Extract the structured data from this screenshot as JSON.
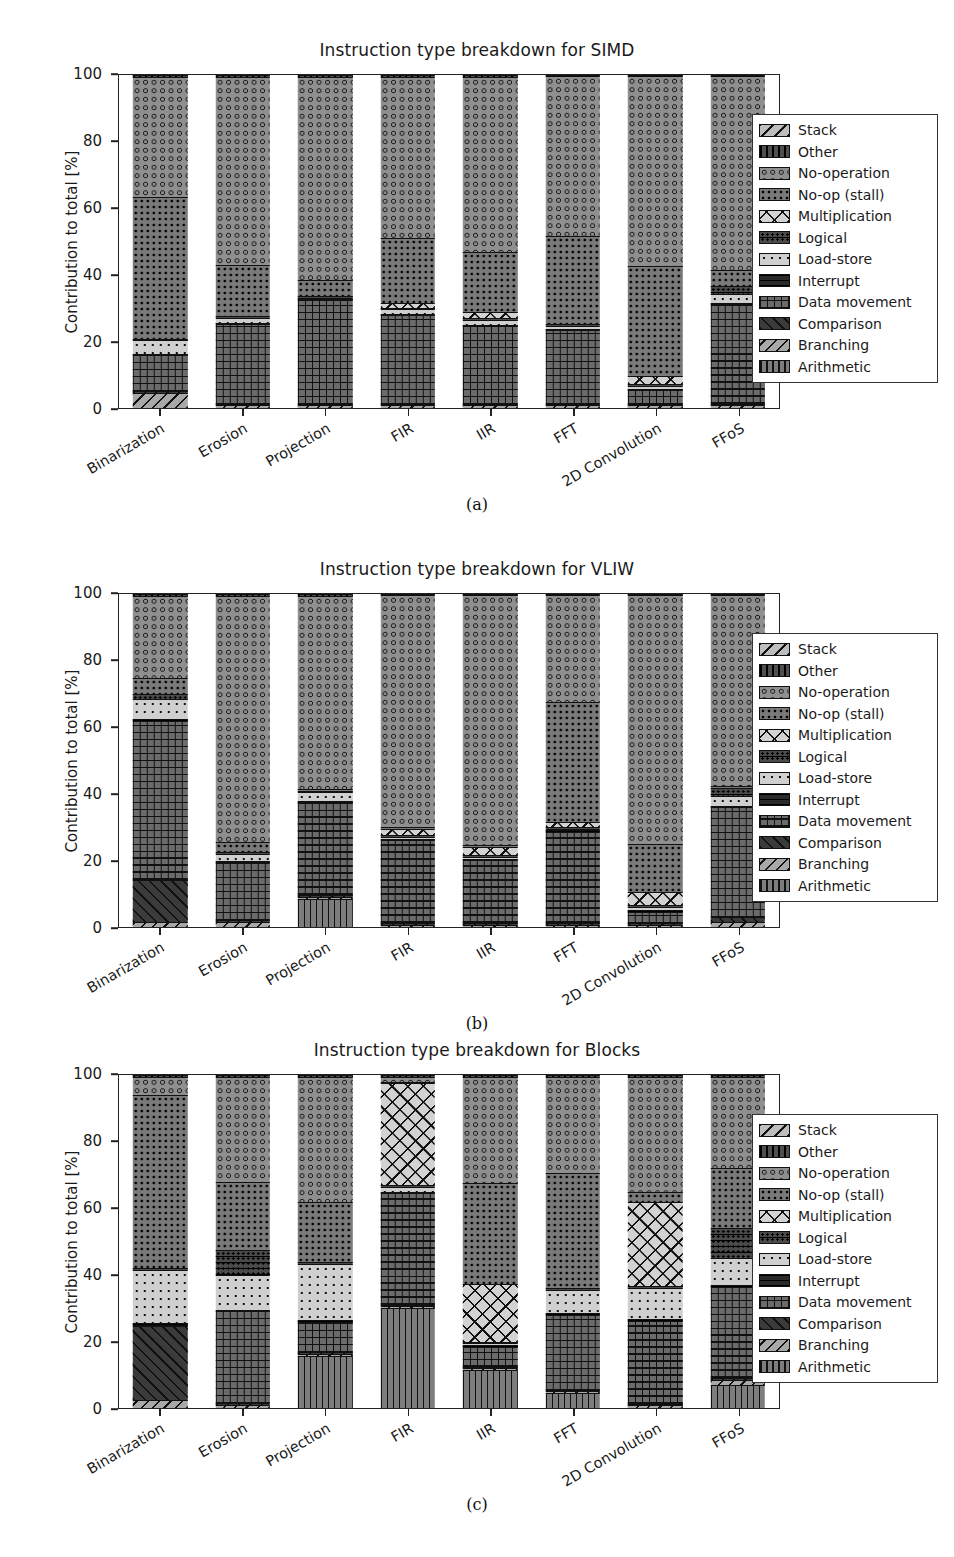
{
  "figure": {
    "ylabel": "Contribution to total [%]",
    "yticks": [
      0,
      20,
      40,
      60,
      80,
      100
    ],
    "ylim": [
      0,
      100
    ],
    "categories": [
      "Binarization",
      "Erosion",
      "Projection",
      "FIR",
      "IIR",
      "FFT",
      "2D Convolution",
      "FFoS"
    ],
    "legend_entries": [
      {
        "label": "Stack",
        "pattern": "p-stack"
      },
      {
        "label": "Other",
        "pattern": "p-other"
      },
      {
        "label": "No-operation",
        "pattern": "p-noop"
      },
      {
        "label": "No-op (stall)",
        "pattern": "p-nopstall"
      },
      {
        "label": "Multiplication",
        "pattern": "p-mult"
      },
      {
        "label": "Logical",
        "pattern": "p-logic"
      },
      {
        "label": "Load-store",
        "pattern": "p-load"
      },
      {
        "label": "Interrupt",
        "pattern": "p-int"
      },
      {
        "label": "Data movement",
        "pattern": "p-data"
      },
      {
        "label": "Comparison",
        "pattern": "p-comp"
      },
      {
        "label": "Branching",
        "pattern": "p-branch"
      },
      {
        "label": "Arithmetic",
        "pattern": "p-arith"
      }
    ],
    "captions": {
      "a": "(a)",
      "b": "(b)",
      "c": "(c)"
    }
  },
  "chart_data": [
    {
      "type": "bar",
      "stacked": true,
      "title": "Instruction type breakdown for SIMD",
      "xlabel": "",
      "ylabel": "Contribution to total [%]",
      "ylim": [
        0,
        100
      ],
      "yticks": [
        0,
        20,
        40,
        60,
        80,
        100
      ],
      "grid": false,
      "legend_position": "right",
      "categories": [
        "Binarization",
        "Erosion",
        "Projection",
        "FIR",
        "IIR",
        "FFT",
        "2D Convolution",
        "FFoS"
      ],
      "series": [
        {
          "name": "Arithmetic",
          "pattern": "p-arith",
          "values": [
            0.0,
            0.0,
            0.0,
            0.0,
            0.0,
            0.0,
            0.0,
            0.0
          ]
        },
        {
          "name": "Branching",
          "pattern": "p-branch",
          "values": [
            4.5,
            0.8,
            0.8,
            0.8,
            0.8,
            0.8,
            0.8,
            0.8
          ]
        },
        {
          "name": "Comparison",
          "pattern": "p-comp",
          "values": [
            0.5,
            0.5,
            0.5,
            0.5,
            0.5,
            0.5,
            0.5,
            0.5
          ]
        },
        {
          "name": "Data movement",
          "pattern": "p-data",
          "values": [
            11.0,
            24.0,
            31.0,
            26.5,
            23.5,
            22.0,
            4.0,
            30.0
          ]
        },
        {
          "name": "Interrupt",
          "pattern": "p-int",
          "values": [
            0.3,
            0.3,
            0.3,
            0.3,
            0.3,
            0.3,
            0.3,
            0.3
          ]
        },
        {
          "name": "Load-store",
          "pattern": "p-load",
          "values": [
            4.0,
            1.5,
            0.5,
            1.5,
            1.5,
            1.0,
            1.0,
            2.5
          ]
        },
        {
          "name": "Logical",
          "pattern": "p-logic",
          "values": [
            0.5,
            0.5,
            0.5,
            0.5,
            0.5,
            0.5,
            0.5,
            2.5
          ]
        },
        {
          "name": "Multiplication",
          "pattern": "p-mult",
          "values": [
            0.0,
            0.0,
            0.0,
            1.5,
            2.0,
            0.0,
            2.5,
            0.0
          ]
        },
        {
          "name": "No-op (stall)",
          "pattern": "p-nopstall",
          "values": [
            42.5,
            15.5,
            5.0,
            19.5,
            18.0,
            26.5,
            33.0,
            5.0
          ]
        },
        {
          "name": "No-operation",
          "pattern": "p-noop",
          "values": [
            36.2,
            56.4,
            60.9,
            48.4,
            52.9,
            48.0,
            57.0,
            58.0
          ]
        },
        {
          "name": "Other",
          "pattern": "p-other",
          "values": [
            0.5,
            0.5,
            0.5,
            0.5,
            0.5,
            0.4,
            0.4,
            0.4
          ]
        },
        {
          "name": "Stack",
          "pattern": "p-stack",
          "values": [
            0.0,
            0.0,
            0.0,
            0.0,
            0.0,
            0.0,
            0.0,
            0.0
          ]
        }
      ]
    },
    {
      "type": "bar",
      "stacked": true,
      "title": "Instruction type breakdown for VLIW",
      "xlabel": "",
      "ylabel": "Contribution to total [%]",
      "ylim": [
        0,
        100
      ],
      "yticks": [
        0,
        20,
        40,
        60,
        80,
        100
      ],
      "grid": false,
      "legend_position": "right",
      "categories": [
        "Binarization",
        "Erosion",
        "Projection",
        "FIR",
        "IIR",
        "FFT",
        "2D Convolution",
        "FFoS"
      ],
      "series": [
        {
          "name": "Arithmetic",
          "pattern": "p-arith",
          "values": [
            0.0,
            0.0,
            8.5,
            0.0,
            0.0,
            0.0,
            0.0,
            0.0
          ]
        },
        {
          "name": "Branching",
          "pattern": "p-branch",
          "values": [
            1.5,
            1.5,
            0.6,
            0.6,
            0.6,
            0.6,
            0.6,
            1.5
          ]
        },
        {
          "name": "Comparison",
          "pattern": "p-comp",
          "values": [
            12.5,
            0.5,
            0.5,
            0.5,
            0.5,
            0.5,
            0.5,
            1.5
          ]
        },
        {
          "name": "Data movement",
          "pattern": "p-data",
          "values": [
            48.0,
            17.5,
            28.0,
            25.0,
            19.0,
            27.5,
            3.5,
            33.0
          ]
        },
        {
          "name": "Interrupt",
          "pattern": "p-int",
          "values": [
            0.4,
            0.4,
            0.4,
            0.4,
            0.4,
            0.4,
            0.4,
            0.4
          ]
        },
        {
          "name": "Load-store",
          "pattern": "p-load",
          "values": [
            6.0,
            2.0,
            2.5,
            0.5,
            0.5,
            0.5,
            1.0,
            3.0
          ]
        },
        {
          "name": "Logical",
          "pattern": "p-logic",
          "values": [
            1.5,
            0.5,
            0.5,
            0.5,
            0.5,
            0.5,
            0.5,
            2.5
          ]
        },
        {
          "name": "Multiplication",
          "pattern": "p-mult",
          "values": [
            0.0,
            0.0,
            0.0,
            2.0,
            2.5,
            1.5,
            4.0,
            0.0
          ]
        },
        {
          "name": "No-op (stall)",
          "pattern": "p-nopstall",
          "values": [
            5.0,
            3.0,
            0.5,
            0.5,
            0.5,
            36.0,
            14.5,
            0.5
          ]
        },
        {
          "name": "No-operation",
          "pattern": "p-noop",
          "values": [
            24.6,
            74.1,
            58.0,
            69.6,
            75.1,
            32.1,
            74.6,
            57.2
          ]
        },
        {
          "name": "Other",
          "pattern": "p-other",
          "values": [
            0.5,
            0.5,
            0.5,
            0.4,
            0.4,
            0.4,
            0.4,
            0.4
          ]
        },
        {
          "name": "Stack",
          "pattern": "p-stack",
          "values": [
            0.0,
            0.0,
            0.0,
            0.0,
            0.0,
            0.0,
            0.0,
            0.0
          ]
        }
      ]
    },
    {
      "type": "bar",
      "stacked": true,
      "title": "Instruction type breakdown for Blocks",
      "xlabel": "",
      "ylabel": "Contribution to total [%]",
      "ylim": [
        0,
        100
      ],
      "yticks": [
        0,
        20,
        40,
        60,
        80,
        100
      ],
      "grid": false,
      "legend_position": "right",
      "categories": [
        "Binarization",
        "Erosion",
        "Projection",
        "FIR",
        "IIR",
        "FFT",
        "2D Convolution",
        "FFoS"
      ],
      "series": [
        {
          "name": "Arithmetic",
          "pattern": "p-arith",
          "values": [
            0.0,
            0.0,
            15.5,
            30.0,
            11.5,
            4.5,
            0.0,
            7.0
          ]
        },
        {
          "name": "Branching",
          "pattern": "p-branch",
          "values": [
            2.5,
            1.0,
            0.8,
            0.5,
            0.5,
            0.5,
            0.8,
            1.5
          ]
        },
        {
          "name": "Comparison",
          "pattern": "p-comp",
          "values": [
            22.0,
            0.5,
            0.5,
            0.5,
            0.5,
            0.5,
            0.5,
            0.5
          ]
        },
        {
          "name": "Data movement",
          "pattern": "p-data",
          "values": [
            0.5,
            27.5,
            9.0,
            33.5,
            6.0,
            22.5,
            25.0,
            27.5
          ]
        },
        {
          "name": "Interrupt",
          "pattern": "p-int",
          "values": [
            0.5,
            0.5,
            0.5,
            0.5,
            0.5,
            0.5,
            0.5,
            0.5
          ]
        },
        {
          "name": "Load-store",
          "pattern": "p-load",
          "values": [
            16.0,
            10.5,
            17.0,
            1.5,
            0.5,
            7.0,
            9.5,
            8.0
          ]
        },
        {
          "name": "Logical",
          "pattern": "p-logic",
          "values": [
            0.5,
            7.5,
            0.5,
            0.5,
            0.5,
            0.5,
            0.5,
            9.0
          ]
        },
        {
          "name": "Multiplication",
          "pattern": "p-mult",
          "values": [
            0.0,
            0.0,
            0.0,
            30.5,
            17.5,
            0.0,
            25.5,
            0.0
          ]
        },
        {
          "name": "No-op (stall)",
          "pattern": "p-nopstall",
          "values": [
            52.0,
            20.5,
            18.0,
            0.5,
            30.5,
            34.5,
            3.0,
            18.0
          ]
        },
        {
          "name": "No-operation",
          "pattern": "p-noop",
          "values": [
            5.5,
            31.5,
            37.7,
            1.5,
            32.0,
            29.0,
            34.7,
            27.5
          ]
        },
        {
          "name": "Other",
          "pattern": "p-other",
          "values": [
            0.5,
            0.5,
            0.5,
            0.5,
            0.5,
            0.5,
            0.5,
            0.5
          ]
        },
        {
          "name": "Stack",
          "pattern": "p-stack",
          "values": [
            0.0,
            0.0,
            0.0,
            0.0,
            0.0,
            0.0,
            0.0,
            0.0
          ]
        }
      ]
    }
  ]
}
